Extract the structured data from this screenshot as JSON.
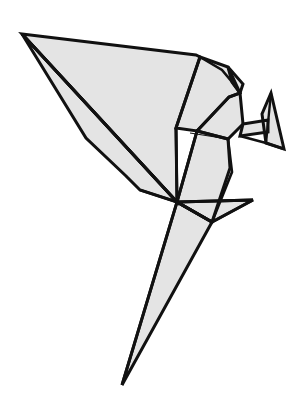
{
  "figure": {
    "name": "origami-bird",
    "canvas": {
      "width": 304,
      "height": 419
    },
    "style": {
      "background_color": "#ffffff",
      "fill_color": "#e4e4e4",
      "outline_color": "#111111",
      "fold_line_color": "#111111",
      "outline_width": 3.0,
      "fold_line_width": 2.4,
      "thin_fold_line_width": 1.1
    },
    "landmarks": [
      {
        "name": "left-wing-tip",
        "x": 22,
        "y": 34
      },
      {
        "name": "upper-back-vertex",
        "x": 200,
        "y": 57
      },
      {
        "name": "shoulder-vertex",
        "x": 228,
        "y": 67
      },
      {
        "name": "nape-vertex",
        "x": 243,
        "y": 84
      },
      {
        "name": "head-top",
        "x": 240,
        "y": 93
      },
      {
        "name": "beak-tip",
        "x": 271,
        "y": 93
      },
      {
        "name": "beak-lower",
        "x": 284,
        "y": 149
      },
      {
        "name": "throat-vertex",
        "x": 243,
        "y": 124
      },
      {
        "name": "chest-vertex",
        "x": 228,
        "y": 139
      },
      {
        "name": "body-center",
        "x": 177,
        "y": 202
      },
      {
        "name": "tail-tip",
        "x": 122,
        "y": 385
      },
      {
        "name": "tail-fin-right",
        "x": 253,
        "y": 200
      },
      {
        "name": "leg-vertex",
        "x": 212,
        "y": 222
      },
      {
        "name": "lower-wing-notch",
        "x": 140,
        "y": 190
      }
    ],
    "facets": [
      {
        "name": "upper-wing-panel",
        "role": "wing"
      },
      {
        "name": "lower-wing-panel",
        "role": "wing"
      },
      {
        "name": "back-panel",
        "role": "body"
      },
      {
        "name": "shoulder-panel",
        "role": "body"
      },
      {
        "name": "neck-panel",
        "role": "neck"
      },
      {
        "name": "head-panel",
        "role": "head"
      },
      {
        "name": "beak-panel",
        "role": "beak"
      },
      {
        "name": "breast-panel",
        "role": "body"
      },
      {
        "name": "tail-panel",
        "role": "tail"
      },
      {
        "name": "tail-fin-panel",
        "role": "tail"
      }
    ],
    "paths": {
      "upper_wing": "M22,34 L196,55 L200,57 L176,128 L177,202 Z",
      "lower_wing": "M22,34 L177,202 L140,190 L126,176 L86,138 Z",
      "wing_fold_mid": "M22,34 L177,202",
      "back_panel": "M200,57 L228,67 L240,93 L229,97 L197,131 L176,128 Z",
      "back_fold_top": "M200,57 L222,70 L232,82 L240,93",
      "shoulder_panel": "M228,67 L243,84 L240,93 L232,82 Z",
      "neck_panel": "M240,93 L243,124 L228,139 L197,131 L229,97 Z",
      "throat_arm": "M243,124 L268,120 L268,132 L240,136 Z",
      "beak": "M271,93 L284,149 L266,143 L262,114 Z",
      "beak_inner": "M271,93 L266,143",
      "beak_lower_fold": "M240,136 L266,143 L284,149",
      "breast_panel": "M197,131 L228,139 L230,168 L212,222 L177,202 Z",
      "breast_fold": "M190,133 L228,139",
      "body_right_edge": "M228,139 L232,172 L212,222",
      "tail": "M177,202 L212,222 L122,385 Z",
      "tail_left_edge": "M177,202 L122,385",
      "tail_fin": "M177,202 L253,200 L212,222 Z",
      "tail_fin_edge": "M253,200 L212,222",
      "body_center_rays": "M177,202 L176,128 M177,202 L197,131 M177,202 L140,190 M177,202 L253,200 M177,202 L212,222 M177,202 L122,385 M177,202 L22,34"
    }
  }
}
